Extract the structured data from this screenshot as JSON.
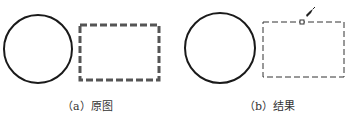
{
  "figure": {
    "panels": [
      {
        "id": "a",
        "caption": "（a）原图",
        "shapes": [
          {
            "type": "circle",
            "style": "solid-thick"
          },
          {
            "type": "rectangle",
            "style": "dashed-thick"
          }
        ]
      },
      {
        "id": "b",
        "caption": "（b）结果",
        "shapes": [
          {
            "type": "circle",
            "style": "solid-thick"
          },
          {
            "type": "rectangle",
            "style": "dashed-thin"
          },
          {
            "type": "pick-box"
          },
          {
            "type": "cursor"
          }
        ]
      }
    ],
    "colors": {
      "stroke": "#1a1a1a",
      "dashed_thick": "#555555",
      "dashed_thin": "#333333"
    }
  }
}
